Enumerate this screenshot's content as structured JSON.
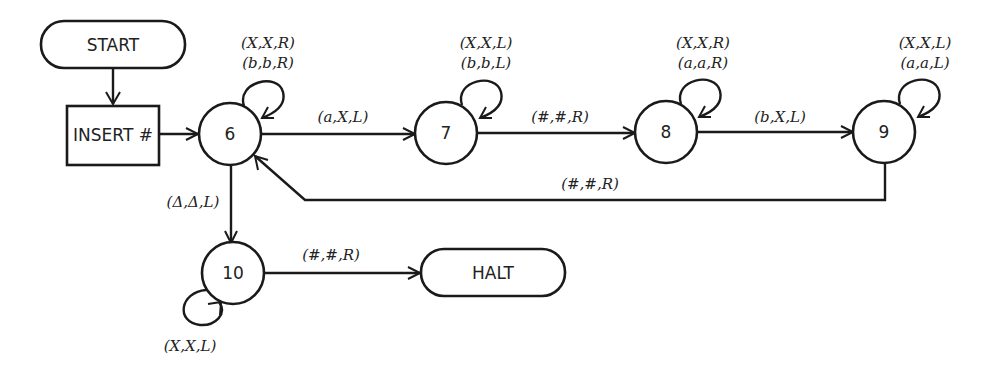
{
  "diagram": {
    "type": "turing-machine-state-diagram",
    "nodes": {
      "start": {
        "label": "START",
        "shape": "rounded-rect"
      },
      "insert": {
        "label": "INSERT #",
        "shape": "rect"
      },
      "s6": {
        "label": "6",
        "shape": "circle"
      },
      "s7": {
        "label": "7",
        "shape": "circle"
      },
      "s8": {
        "label": "8",
        "shape": "circle"
      },
      "s9": {
        "label": "9",
        "shape": "circle"
      },
      "s10": {
        "label": "10",
        "shape": "circle"
      },
      "halt": {
        "label": "HALT",
        "shape": "rounded-rect"
      }
    },
    "loops": {
      "s6": [
        "(X,X,R)",
        "(b,b,R)"
      ],
      "s7": [
        "(X,X,L)",
        "(b,b,L)"
      ],
      "s8": [
        "(X,X,R)",
        "(a,a,R)"
      ],
      "s9": [
        "(X,X,L)",
        "(a,a,L)"
      ],
      "s10": [
        "(X,X,L)"
      ]
    },
    "edges": {
      "s6_s7": "(a,X,L)",
      "s7_s8": "(#,#,R)",
      "s8_s9": "(b,X,L)",
      "s9_s6": "(#,#,R)",
      "s6_s10": "(Δ,Δ,L)",
      "s10_halt": "(#,#,R)"
    }
  }
}
